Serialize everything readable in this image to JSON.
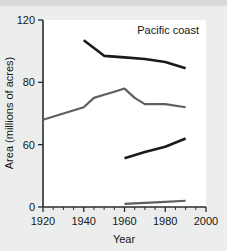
{
  "figure": {
    "annotation": "Pacific coast",
    "background_color": "#eceeed",
    "plot_background_color": "#ffffff"
  },
  "chart_data": {
    "type": "line",
    "title": "",
    "annotation": "Pacific coast",
    "xlabel": "Year",
    "ylabel": "Area (millions of acres)",
    "xlim": [
      1920,
      2000
    ],
    "ylim": [
      0,
      120
    ],
    "grid": false,
    "legend": "none",
    "y_axis_note": "Broken axis: labelled ticks 0, 60, 80, 120 are drawn at equal pixel spacing, so the 0-60 interval is compressed.",
    "xticks": [
      1920,
      1940,
      1960,
      1980,
      2000
    ],
    "xtick_labels": [
      "1920",
      "1940",
      "1960",
      "1980",
      "2000"
    ],
    "x_minor_tick_step": 5,
    "yticks": [
      0,
      60,
      80,
      120
    ],
    "ytick_labels": [
      "0",
      "60",
      "80",
      "120"
    ],
    "series": [
      {
        "name": "upper-black",
        "color": "#1a1a1a",
        "width": 2.6,
        "x": [
          1940,
          1950,
          1960,
          1970,
          1980,
          1990
        ],
        "values": [
          107,
          97,
          96,
          95,
          93,
          89
        ]
      },
      {
        "name": "upper-gray",
        "color": "#5f5f5f",
        "width": 2.2,
        "x": [
          1920,
          1930,
          1940,
          1945,
          1950,
          1955,
          1960,
          1965,
          1970,
          1980,
          1990
        ],
        "values": [
          68,
          70,
          72,
          75,
          76,
          77,
          78,
          75,
          73,
          73,
          72
        ]
      },
      {
        "name": "lower-black",
        "color": "#1a1a1a",
        "width": 2.6,
        "x": [
          1960,
          1970,
          1980,
          1990
        ],
        "values": [
          47,
          53,
          58,
          62
        ]
      },
      {
        "name": "lower-gray",
        "color": "#5f5f5f",
        "width": 2.2,
        "x": [
          1960,
          1970,
          1980,
          1990
        ],
        "values": [
          3,
          4,
          5,
          6
        ]
      }
    ]
  }
}
